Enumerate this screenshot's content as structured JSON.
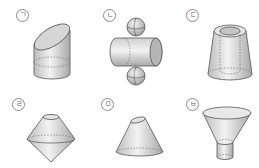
{
  "figures": [
    {
      "id": "giyeok",
      "label": "ㄱ",
      "shape": "obliquely cut cylinder"
    },
    {
      "id": "nieun",
      "label": "ㄴ",
      "shape": "horizontal cylinder with two spheres"
    },
    {
      "id": "digeut",
      "label": "ㄷ",
      "shape": "frustum with cylindrical hole"
    },
    {
      "id": "rieul",
      "label": "ㄹ",
      "shape": "frustum on inverted cone"
    },
    {
      "id": "mieum",
      "label": "ㅁ",
      "shape": "obliquely cut cone"
    },
    {
      "id": "bieup",
      "label": "ㅂ",
      "shape": "funnel (frustum on cylinder)"
    }
  ],
  "colors": {
    "stroke": "#555555",
    "fill_light": "#e8e8e8",
    "fill_dark": "#b8b8b8",
    "dash": "#666666"
  }
}
